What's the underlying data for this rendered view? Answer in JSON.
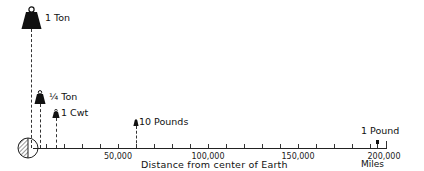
{
  "diagram": {
    "xlabel": "Distance from center of Earth",
    "units": "Miles",
    "ticks": [
      {
        "value": 50000,
        "label": "50,000"
      },
      {
        "value": 100000,
        "label": "100,000"
      },
      {
        "value": 150000,
        "label": "150,000"
      },
      {
        "value": 200000,
        "label": "200,000"
      }
    ],
    "weights": [
      {
        "label": "1 Ton",
        "icon": "weight-icon",
        "size": "large"
      },
      {
        "label": "¼ Ton",
        "icon": "weight-icon",
        "size": "medium"
      },
      {
        "label": "1 Cwt",
        "icon": "weight-icon",
        "size": "small"
      },
      {
        "label": "10 Pounds",
        "icon": "weight-icon",
        "size": "tiny"
      },
      {
        "label": "1 Pound",
        "icon": "weight-icon",
        "size": "dot"
      }
    ],
    "earth_icon": "earth-half-hatched-icon",
    "colors": {
      "ink": "#111111",
      "background": "#ffffff"
    }
  }
}
